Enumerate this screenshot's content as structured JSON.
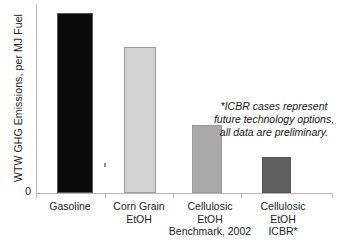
{
  "chart_data": {
    "type": "bar",
    "title": "",
    "subtitle": "",
    "xlabel": "",
    "ylabel": "WTW GHG Emissions, per MJ Fuel",
    "categories": [
      "Gasoline",
      "Corn Grain\nEtOH",
      "Cellulosic\nEtOH\nBenchmark, 2002",
      "Cellulosic\nEtOH\nICBR*"
    ],
    "values": [
      95,
      77,
      36,
      19
    ],
    "ylim": [
      0,
      100
    ],
    "ytick_labels": [
      "0"
    ],
    "grid": false,
    "legend": null,
    "bar_colors": [
      "#0a0a0a",
      "#d2d2d2",
      "#a9a9a9",
      "#606060"
    ],
    "annotations": [
      "*ICBR cases represent future technology options, all data are preliminary."
    ]
  },
  "axes": {
    "zero_label": "0",
    "y_title": "WTW GHG Emissions, per MJ Fuel"
  },
  "bars": [
    {
      "label": "Gasoline",
      "value": 95,
      "color": "#0a0a0a"
    },
    {
      "label": "Corn Grain EtOH",
      "value": 77,
      "color": "#d2d2d2"
    },
    {
      "label": "Cellulosic EtOH Benchmark, 2002",
      "value": 36,
      "color": "#a9a9a9"
    },
    {
      "label": "Cellulosic EtOH ICBR*",
      "value": 19,
      "color": "#606060"
    }
  ],
  "category_labels": [
    "Gasoline",
    "Corn Grain\nEtOH",
    "Cellulosic\nEtOH\nBenchmark, 2002",
    "Cellulosic\nEtOH\nICBR*"
  ],
  "annotation": {
    "text": "*ICBR cases represent future technology options, all data are preliminary."
  }
}
